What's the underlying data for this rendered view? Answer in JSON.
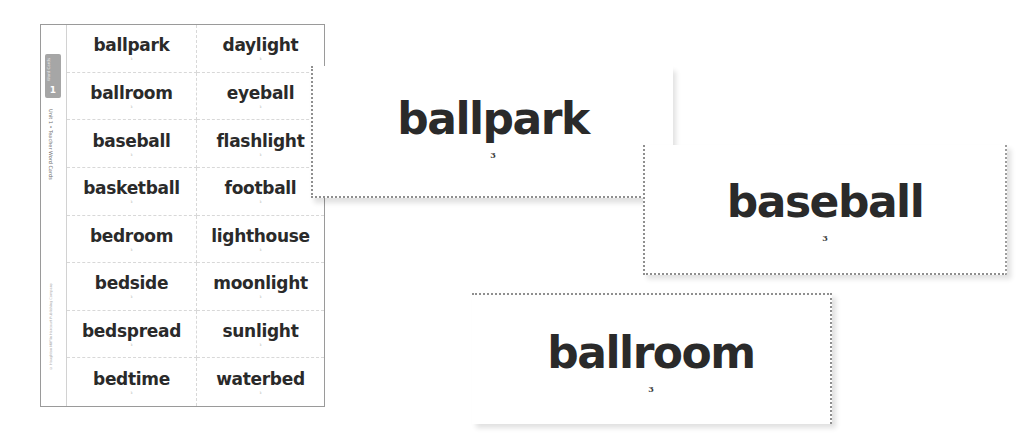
{
  "sheet": {
    "strip": {
      "badge_label": "Word Cards",
      "badge_number": "1",
      "title": "Unit 1 • Teacher Word Cards",
      "copyright": "© Houghton Mifflin Harcourt Publishing Company"
    },
    "rows": [
      {
        "left": {
          "word": "ballpark",
          "mark": "3"
        },
        "right": {
          "word": "daylight",
          "mark": "3"
        }
      },
      {
        "left": {
          "word": "ballroom",
          "mark": "3"
        },
        "right": {
          "word": "eyeball",
          "mark": "3"
        }
      },
      {
        "left": {
          "word": "baseball",
          "mark": "3"
        },
        "right": {
          "word": "flashlight",
          "mark": "3"
        }
      },
      {
        "left": {
          "word": "basketball",
          "mark": "3"
        },
        "right": {
          "word": "football",
          "mark": "3"
        }
      },
      {
        "left": {
          "word": "bedroom",
          "mark": "3"
        },
        "right": {
          "word": "lighthouse",
          "mark": "3"
        }
      },
      {
        "left": {
          "word": "bedside",
          "mark": "3"
        },
        "right": {
          "word": "moonlight",
          "mark": "3"
        }
      },
      {
        "left": {
          "word": "bedspread",
          "mark": "3"
        },
        "right": {
          "word": "sunlight",
          "mark": "3"
        }
      },
      {
        "left": {
          "word": "bedtime",
          "mark": "3"
        },
        "right": {
          "word": "waterbed",
          "mark": "3"
        }
      }
    ]
  },
  "cards": [
    {
      "word": "ballpark",
      "number": "3"
    },
    {
      "word": "baseball",
      "number": "3"
    },
    {
      "word": "ballroom",
      "number": "3"
    }
  ],
  "colors": {
    "text": "#2a2a2a",
    "border": "#9a9a9a",
    "badge": "#a6a6a6",
    "background": "#ffffff"
  }
}
